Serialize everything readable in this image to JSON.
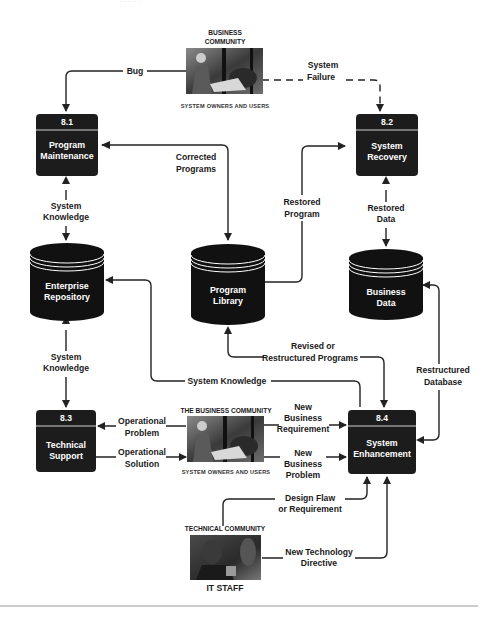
{
  "header_fragment": "· · · · · ·",
  "entities": {
    "business_top": {
      "title_line1": "BUSINESS",
      "title_line2": "COMMUNITY",
      "subtitle": "SYSTEM OWNERS AND USERS"
    },
    "business_mid": {
      "title": "THE BUSINESS COMMUNITY",
      "subtitle": "SYSTEM OWNERS AND USERS"
    },
    "technical": {
      "title": "TECHNICAL COMMUNITY",
      "staff": "IT STAFF"
    }
  },
  "processes": [
    {
      "id": "8.1",
      "line1": "Program",
      "line2": "Maintenance"
    },
    {
      "id": "8.2",
      "line1": "System",
      "line2": "Recovery"
    },
    {
      "id": "8.3",
      "line1": "Technical",
      "line2": "Support"
    },
    {
      "id": "8.4",
      "line1": "System",
      "line2": "Enhancement"
    }
  ],
  "data_stores": [
    {
      "line1": "Enterprise",
      "line2": "Repository"
    },
    {
      "line1": "Program",
      "line2": "Library"
    },
    {
      "line1": "Business",
      "line2": "Data"
    }
  ],
  "flows": {
    "bug": "Bug",
    "system_failure": [
      "System",
      "Failure"
    ],
    "corrected_programs": [
      "Corrected",
      "Programs"
    ],
    "restored_program": [
      "Restored",
      "Program"
    ],
    "restored_data": [
      "Restored",
      "Data"
    ],
    "system_knowledge_top": [
      "System",
      "Knowledge"
    ],
    "system_knowledge_mid": [
      "System",
      "Knowledge"
    ],
    "system_knowledge_long": "System Knowledge",
    "revised_programs": [
      "Revised or",
      "Restructured Programs"
    ],
    "restructured_database": [
      "Restructured",
      "Database"
    ],
    "operational_problem": [
      "Operational",
      "Problem"
    ],
    "operational_solution": [
      "Operational",
      "Solution"
    ],
    "new_business_requirement": [
      "New",
      "Business",
      "Requirement"
    ],
    "new_business_problem": [
      "New",
      "Business",
      "Problem"
    ],
    "design_flaw": [
      "Design Flaw",
      "or Requirement"
    ],
    "new_technology": [
      "New Technology",
      "Directive"
    ]
  },
  "colors": {
    "process_fill": "#1c1c1c",
    "store_fill": "#111111",
    "line": "#222222",
    "footer_rule": "#9a9a9a"
  }
}
